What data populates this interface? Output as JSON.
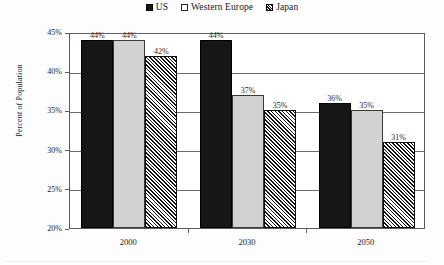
{
  "chart_data": {
    "type": "bar",
    "title": "",
    "subtitle": "",
    "xlabel": "",
    "ylabel": "Percent of Population",
    "categories": [
      "2000",
      "2030",
      "2050"
    ],
    "series": [
      {
        "name": "US",
        "values": [
          44,
          44,
          36
        ],
        "labels": [
          "44%",
          "44%",
          "36%"
        ],
        "style": "solid-black",
        "color": "#161616"
      },
      {
        "name": "Western Europe",
        "values": [
          44,
          37,
          35
        ],
        "labels": [
          "44%",
          "37%",
          "35%"
        ],
        "style": "light-gray",
        "color": "#d2d2d2"
      },
      {
        "name": "Japan",
        "values": [
          42,
          35,
          31
        ],
        "labels": [
          "42%",
          "35%",
          "31%"
        ],
        "style": "diagonal-hatch",
        "color": "#ffffff"
      }
    ],
    "ylim": [
      20,
      45
    ],
    "ytick_values": [
      20,
      25,
      30,
      35,
      40,
      45
    ],
    "ytick_labels": [
      "20%",
      "25%",
      "30%",
      "35%",
      "40%",
      "45%"
    ],
    "grid": "horizontal",
    "legend_position": "top-center",
    "value_labels": true
  },
  "corrected_series_values": {
    "note_not_rendered": "group values by category",
    "by_category": [
      {
        "category": "2000",
        "us": 44,
        "western_europe": 44,
        "japan": 42
      },
      {
        "category": "2030",
        "us": 37,
        "western_europe": 37,
        "japan": 35
      },
      {
        "category": "2050",
        "us": 36,
        "western_europe": 35,
        "japan": 31
      }
    ]
  },
  "legend": {
    "entries": [
      {
        "label": "US",
        "swatch": "solid-square-icon"
      },
      {
        "label": "Western Europe",
        "swatch": "outline-square-icon"
      },
      {
        "label": "Japan",
        "swatch": "hatched-square-icon"
      }
    ]
  },
  "axes": {
    "y_title": "Percent of Population",
    "y_ticks": [
      "45%",
      "40%",
      "35%",
      "30%",
      "25%",
      "20%"
    ],
    "x_ticks": [
      "2000",
      "2030",
      "2050"
    ]
  }
}
